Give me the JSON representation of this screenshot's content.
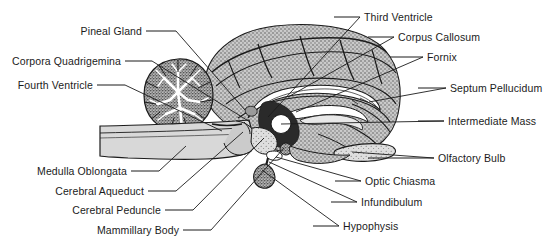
{
  "figure": {
    "view": "midsagittal",
    "background_color": "#ffffff",
    "line_color": "#1b1b1b",
    "text_color": "#1b1b1b",
    "tissue_fill": "#b9b9b9",
    "tissue_fill_light": "#d6d6d6",
    "tissue_fill_white": "#ffffff"
  },
  "labels": {
    "left": [
      {
        "id": "pineal-gland",
        "text": "Pineal Gland",
        "text_x": 79,
        "text_y": 26,
        "dash_x1": 146,
        "dash_y1": 31,
        "dash_x2": 176,
        "dash_y2": 31,
        "leader_x2": 245,
        "leader_y2": 110
      },
      {
        "id": "corpora-quadrigemina",
        "text": "Corpora Quadrigemina",
        "text_x": 8,
        "text_y": 56,
        "dash_x1": 125,
        "dash_y1": 61,
        "dash_x2": 152,
        "dash_y2": 61,
        "leader_x2": 250,
        "leader_y2": 122
      },
      {
        "id": "fourth-ventricle",
        "text": "Fourth Ventricle",
        "text_x": 12,
        "text_y": 80,
        "dash_x1": 97,
        "dash_y1": 85,
        "dash_x2": 125,
        "dash_y2": 85,
        "leader_x2": 222,
        "leader_y2": 131
      },
      {
        "id": "medulla-oblongata",
        "text": "Medulla Oblongata",
        "text_x": 29,
        "text_y": 166,
        "dash_x1": 131,
        "dash_y1": 171,
        "dash_x2": 159,
        "dash_y2": 171,
        "leader_x2": 186,
        "leader_y2": 146
      },
      {
        "id": "cerebral-aqueduct",
        "text": "Cerebral Aqueduct",
        "text_x": 46,
        "text_y": 186,
        "dash_x1": 148,
        "dash_y1": 191,
        "dash_x2": 176,
        "dash_y2": 191,
        "leader_x2": 243,
        "leader_y2": 132
      },
      {
        "id": "cerebral-peduncle",
        "text": "Cerebral Peduncle",
        "text_x": 66,
        "text_y": 205,
        "dash_x1": 165,
        "dash_y1": 210,
        "dash_x2": 193,
        "dash_y2": 210,
        "leader_x2": 264,
        "leader_y2": 138
      },
      {
        "id": "mammillary-body",
        "text": "Mammillary Body",
        "text_x": 92,
        "text_y": 225,
        "dash_x1": 183,
        "dash_y1": 230,
        "dash_x2": 211,
        "dash_y2": 230,
        "leader_x2": 284,
        "leader_y2": 148
      }
    ],
    "right": [
      {
        "id": "third-ventricle",
        "text": "Third Ventricle",
        "text_x": 364,
        "text_y": 12,
        "dash_x1": 334,
        "dash_y1": 17,
        "dash_x2": 360,
        "dash_y2": 17,
        "leader_x2": 268,
        "leader_y2": 117
      },
      {
        "id": "corpus-callosum",
        "text": "Corpus Callosum",
        "text_x": 398,
        "text_y": 32,
        "dash_x1": 368,
        "dash_y1": 37,
        "dash_x2": 394,
        "dash_y2": 37,
        "leader_x2": 288,
        "leader_y2": 97
      },
      {
        "id": "fornix",
        "text": "Fornix",
        "text_x": 427,
        "text_y": 52,
        "dash_x1": 390,
        "dash_y1": 57,
        "dash_x2": 423,
        "dash_y2": 57,
        "leader_x2": 296,
        "leader_y2": 112
      },
      {
        "id": "septum-pellucidum",
        "text": "Septum Pellucidum",
        "text_x": 450,
        "text_y": 83,
        "dash_x1": 418,
        "dash_y1": 88,
        "dash_x2": 446,
        "dash_y2": 88,
        "leader_x2": 369,
        "leader_y2": 102
      },
      {
        "id": "intermediate-mass",
        "text": "Intermediate Mass",
        "text_x": 448,
        "text_y": 116,
        "dash_x1": 418,
        "dash_y1": 121,
        "dash_x2": 444,
        "dash_y2": 121,
        "leader_x2": 281,
        "leader_y2": 124
      },
      {
        "id": "olfactory-bulb",
        "text": "Olfactory Bulb",
        "text_x": 438,
        "text_y": 153,
        "dash_x1": 368,
        "dash_y1": 158,
        "dash_x2": 434,
        "dash_y2": 158,
        "leader_x2": 352,
        "leader_y2": 152
      },
      {
        "id": "optic-chiasma",
        "text": "Optic Chiasma",
        "text_x": 365,
        "text_y": 176,
        "dash_x1": 335,
        "dash_y1": 181,
        "dash_x2": 361,
        "dash_y2": 181,
        "leader_x2": 276,
        "leader_y2": 157
      },
      {
        "id": "infundibulum",
        "text": "Infundibulum",
        "text_x": 361,
        "text_y": 197,
        "dash_x1": 331,
        "dash_y1": 202,
        "dash_x2": 357,
        "dash_y2": 202,
        "leader_x2": 269,
        "leader_y2": 162
      },
      {
        "id": "hypophysis",
        "text": "Hypophysis",
        "text_x": 343,
        "text_y": 221,
        "dash_x1": 313,
        "dash_y1": 226,
        "dash_x2": 339,
        "dash_y2": 226,
        "leader_x2": 262,
        "leader_y2": 170
      }
    ]
  }
}
